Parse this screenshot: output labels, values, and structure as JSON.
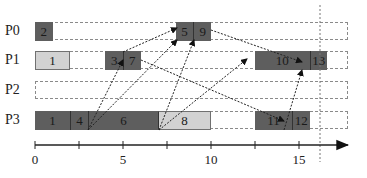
{
  "processors": [
    {
      "id": "P0",
      "label": "P0",
      "top": 22
    },
    {
      "id": "P1",
      "label": "P1",
      "top": 51
    },
    {
      "id": "P2",
      "label": "P2",
      "top": 81
    },
    {
      "id": "P3",
      "label": "P3",
      "top": 111
    }
  ],
  "tasks": [
    {
      "id": "2",
      "label": "2",
      "proc": "P0",
      "start": 0,
      "end": 1,
      "shade": "dark"
    },
    {
      "id": "5",
      "label": "5",
      "proc": "P0",
      "start": 8,
      "end": 9,
      "shade": "dark"
    },
    {
      "id": "9",
      "label": "9",
      "proc": "P0",
      "start": 9,
      "end": 10,
      "shade": "dark"
    },
    {
      "id": "1a",
      "label": "1",
      "proc": "P1",
      "start": 0,
      "end": 2,
      "shade": "light"
    },
    {
      "id": "3",
      "label": "3",
      "proc": "P1",
      "start": 4,
      "end": 5,
      "shade": "dark"
    },
    {
      "id": "7",
      "label": "7",
      "proc": "P1",
      "start": 5,
      "end": 6,
      "shade": "dark"
    },
    {
      "id": "10",
      "label": "10",
      "proc": "P1",
      "start": 12.5,
      "end": 15.6,
      "shade": "dark"
    },
    {
      "id": "13",
      "label": "13",
      "proc": "P1",
      "start": 15.6,
      "end": 16.6,
      "shade": "dark"
    },
    {
      "id": "1b",
      "label": "1",
      "proc": "P3",
      "start": 0,
      "end": 2,
      "shade": "dark"
    },
    {
      "id": "4",
      "label": "4",
      "proc": "P3",
      "start": 2,
      "end": 3,
      "shade": "dark"
    },
    {
      "id": "6",
      "label": "6",
      "proc": "P3",
      "start": 3,
      "end": 7,
      "shade": "dark"
    },
    {
      "id": "8",
      "label": "8",
      "proc": "P3",
      "start": 7,
      "end": 10,
      "shade": "light"
    },
    {
      "id": "11",
      "label": "11",
      "proc": "P3",
      "start": 12.5,
      "end": 14.6,
      "shade": "dark"
    },
    {
      "id": "12",
      "label": "12",
      "proc": "P3",
      "start": 14.6,
      "end": 15.6,
      "shade": "dark"
    }
  ],
  "dependencies": [
    {
      "from": [
        88,
        130
      ],
      "to": [
        123,
        60
      ]
    },
    {
      "from": [
        88,
        130
      ],
      "to": [
        177,
        40
      ]
    },
    {
      "from": [
        123,
        52
      ],
      "to": [
        177,
        28
      ]
    },
    {
      "from": [
        141,
        60
      ],
      "to": [
        284,
        121
      ]
    },
    {
      "from": [
        159,
        130
      ],
      "to": [
        194,
        40
      ]
    },
    {
      "from": [
        159,
        130
      ],
      "to": [
        247,
        59
      ]
    },
    {
      "from": [
        211,
        30
      ],
      "to": [
        302,
        62
      ]
    },
    {
      "from": [
        284,
        130
      ],
      "to": [
        302,
        70
      ]
    }
  ],
  "axis": {
    "ticks": [
      0,
      2.5,
      5,
      7.5,
      10,
      12.5,
      15
    ],
    "labels": [
      {
        "value": 0,
        "text": "0"
      },
      {
        "value": 5,
        "text": "5"
      },
      {
        "value": 10,
        "text": "10"
      },
      {
        "value": 15,
        "text": "15"
      }
    ],
    "origin_x": 35,
    "px_per_unit": 17.6,
    "y": 145,
    "end_x": 348
  },
  "deadline_line_x": 320,
  "colors": {
    "dark": "#5e5e5e",
    "light": "#d2d2d2",
    "grid": "#8a8a8a",
    "text": "#222222"
  }
}
